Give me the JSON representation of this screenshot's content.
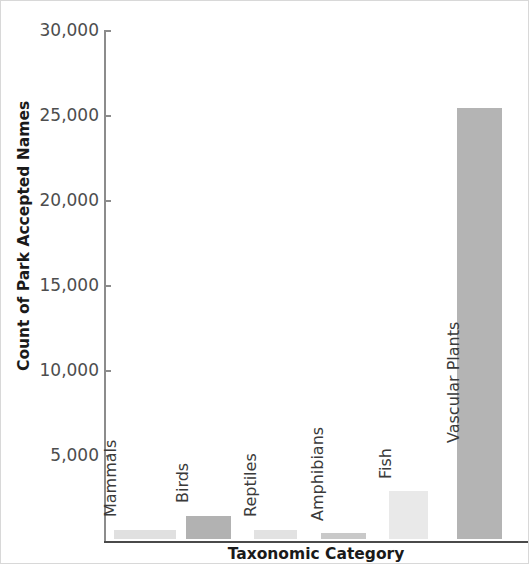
{
  "chart_data": {
    "type": "bar",
    "title": "",
    "xlabel": "Taxonomic Category",
    "ylabel": "Count of Park Accepted Names",
    "categories": [
      "Mammals",
      "Birds",
      "Reptiles",
      "Amphibians",
      "Fish",
      "Vascular Plants"
    ],
    "values": [
      530,
      1350,
      530,
      350,
      2820,
      25350
    ],
    "ylim": [
      0,
      30000
    ],
    "ytick_labels": [
      "30,000",
      "25,000",
      "20,000",
      "15,000",
      "10,000",
      "5,000"
    ],
    "ytick_values": [
      30000,
      25000,
      20000,
      15000,
      10000,
      5000
    ],
    "grid": false,
    "legend": false,
    "bar_colors": [
      "#e0e0e0",
      "#b2b2b2",
      "#e2e2e2",
      "#c9c9c9",
      "#e9e9e9",
      "#b4b4b4"
    ],
    "axis_color": "#8c8c8c",
    "baseline_color": "#4a4a4a",
    "background": "#ffffff"
  },
  "axes": {
    "y_title": "Count of Park Accepted Names",
    "x_title": "Taxonomic Category"
  }
}
